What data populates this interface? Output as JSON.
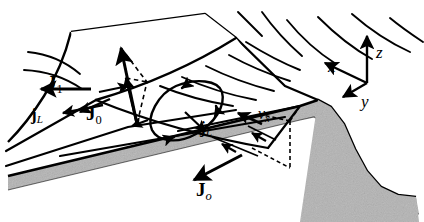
{
  "figure": {
    "background_color": "#ffffff",
    "ink_color": "#000000",
    "substrate_fill": "#b3b3b3",
    "substrate_edge": "#000000"
  },
  "labels": {
    "J1": {
      "symbol": "J",
      "subscript": "1",
      "bold": true
    },
    "jL_left": {
      "symbol": "j",
      "subscript": "L",
      "bold": true
    },
    "J0_left": {
      "symbol": "J",
      "subscript": "0",
      "bold": true
    },
    "jL_mid": {
      "symbol": "j",
      "subscript": "L",
      "bold": true
    },
    "J0_bottom": {
      "symbol": "J",
      "subscript": "o",
      "bold": true
    },
    "vx": {
      "symbol": "v",
      "subscript": "x",
      "bold": false
    }
  },
  "axes": {
    "x": {
      "label": "x",
      "direction": "upper-left"
    },
    "y": {
      "label": "y",
      "direction": "lower-left"
    },
    "z": {
      "label": "z",
      "direction": "up"
    },
    "origin_px": [
      367,
      83
    ]
  },
  "elements": {
    "surface_striations": "curved parallel field lines on upper sheet",
    "white_patch": "unstriated quadrilateral facet",
    "current_loop": "closed teardrop circulation with arrowheads",
    "dashed_construction": "dashed vector-decomposition lines",
    "substrate_band": "speckled grey slab with corrugated trough"
  }
}
